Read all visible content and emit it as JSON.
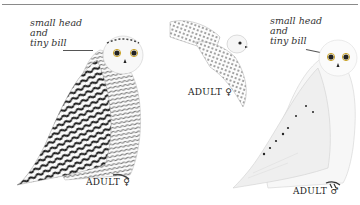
{
  "plate": {
    "subject": "Snowy Owl",
    "figures": [
      {
        "id": "adult-female-perched",
        "caption": "ADULT",
        "sex_symbol": "♀",
        "annotation": [
          "small head",
          "and",
          "tiny bill"
        ]
      },
      {
        "id": "adult-female-flight",
        "caption": "ADULT",
        "sex_symbol": "♀"
      },
      {
        "id": "adult-male-perched",
        "caption": "ADULT",
        "sex_symbol": "♂",
        "annotation": [
          "small head",
          "and",
          "tiny bill"
        ]
      }
    ]
  },
  "colors": {
    "background": "#ffffff",
    "rule": "#8a8a8a",
    "barring": "#1a1a1a",
    "plumage_shade": "#e8e8e8"
  }
}
